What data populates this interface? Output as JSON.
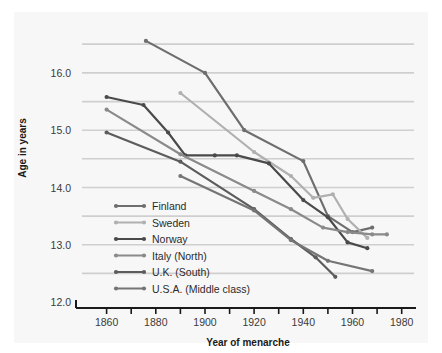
{
  "chart_data": {
    "type": "line",
    "title": "",
    "xlabel": "Year of menarche",
    "ylabel": "Age in years",
    "xlim": [
      1850,
      1985
    ],
    "ylim": [
      12.0,
      16.75
    ],
    "xticks": [
      1860,
      1870,
      1880,
      1890,
      1900,
      1910,
      1920,
      1930,
      1940,
      1950,
      1960,
      1970,
      1980
    ],
    "xticklabels": [
      "1860",
      "",
      "1880",
      "",
      "1900",
      "",
      "1920",
      "",
      "1940",
      "",
      "1960",
      "",
      "1980"
    ],
    "yticks": [
      12.0,
      12.5,
      13.0,
      13.5,
      14.0,
      14.5,
      15.0,
      15.5,
      16.0,
      16.5
    ],
    "yticklabels": [
      "12.0",
      "",
      "13.0",
      "",
      "14.0",
      "",
      "15.0",
      "",
      "16.0",
      ""
    ],
    "grid": "horizontal",
    "legend_position": "lower-left-inside",
    "series": [
      {
        "name": "Finland",
        "color": "#6e6e6e",
        "points": [
          [
            1876,
            16.56
          ],
          [
            1900,
            16.0
          ],
          [
            1916,
            15.0
          ],
          [
            1940,
            14.46
          ],
          [
            1950,
            13.5
          ],
          [
            1960,
            13.22
          ],
          [
            1968,
            13.3
          ]
        ]
      },
      {
        "name": "Sweden",
        "color": "#b0b0b0",
        "points": [
          [
            1890,
            15.65
          ],
          [
            1920,
            14.62
          ],
          [
            1935,
            14.2
          ],
          [
            1944,
            13.82
          ],
          [
            1952,
            13.88
          ],
          [
            1958,
            13.45
          ],
          [
            1966,
            13.12
          ]
        ]
      },
      {
        "name": "Norway",
        "color": "#4a4a4a",
        "points": [
          [
            1860,
            15.58
          ],
          [
            1875,
            15.44
          ],
          [
            1885,
            14.96
          ],
          [
            1892,
            14.56
          ],
          [
            1904,
            14.56
          ],
          [
            1913,
            14.56
          ],
          [
            1926,
            14.42
          ],
          [
            1940,
            13.78
          ],
          [
            1950,
            13.48
          ],
          [
            1958,
            13.04
          ],
          [
            1966,
            12.94
          ]
        ]
      },
      {
        "name": "Italy (North)",
        "color": "#8a8a8a",
        "points": [
          [
            1860,
            15.36
          ],
          [
            1890,
            14.58
          ],
          [
            1920,
            13.94
          ],
          [
            1935,
            13.62
          ],
          [
            1948,
            13.3
          ],
          [
            1958,
            13.22
          ],
          [
            1968,
            13.18
          ],
          [
            1974,
            13.18
          ]
        ]
      },
      {
        "name": "U.K. (South)",
        "color": "#5c5c5c",
        "points": [
          [
            1860,
            14.96
          ],
          [
            1890,
            14.45
          ],
          [
            1920,
            13.62
          ],
          [
            1935,
            13.1
          ],
          [
            1945,
            12.78
          ],
          [
            1953,
            12.44
          ]
        ]
      },
      {
        "name": "U.S.A. (Middle class)",
        "color": "#757575",
        "points": [
          [
            1890,
            14.2
          ],
          [
            1920,
            13.6
          ],
          [
            1935,
            13.08
          ],
          [
            1950,
            12.72
          ],
          [
            1968,
            12.54
          ]
        ]
      }
    ]
  },
  "axes": {
    "ylabel": "Age in years",
    "xlabel": "Year of menarche",
    "yticklabels": [
      {
        "value": "12.0"
      },
      {
        "value": "13.0"
      },
      {
        "value": "14.0"
      },
      {
        "value": "15.0"
      },
      {
        "value": "16.0"
      }
    ],
    "xticklabels": [
      {
        "value": "1860"
      },
      {
        "value": "1880"
      },
      {
        "value": "1900"
      },
      {
        "value": "1920"
      },
      {
        "value": "1940"
      },
      {
        "value": "1960"
      },
      {
        "value": "1980"
      }
    ]
  },
  "legend": {
    "items": [
      {
        "label": "Finland",
        "color": "#6e6e6e"
      },
      {
        "label": "Sweden",
        "color": "#b0b0b0"
      },
      {
        "label": "Norway",
        "color": "#4a4a4a"
      },
      {
        "label": "Italy (North)",
        "color": "#8a8a8a"
      },
      {
        "label": "U.K. (South)",
        "color": "#5c5c5c"
      },
      {
        "label": "U.S.A. (Middle class)",
        "color": "#757575"
      }
    ]
  },
  "style": {
    "background": "#f7f7f7",
    "gridline_color": "#cfcfcf",
    "axis_color": "#1a1a1a"
  }
}
